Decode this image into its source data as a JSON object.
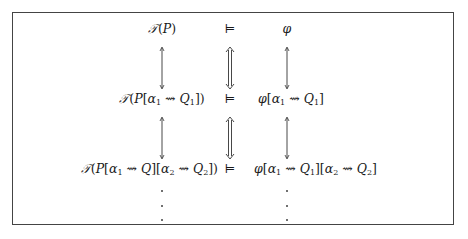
{
  "diagram": {
    "rows": [
      {
        "left": "T(P)",
        "relation": "⊨",
        "right": "φ"
      },
      {
        "left": "T(P[α1 ⇝ Q1])",
        "relation": "⊨",
        "right": "φ[α1 ⇝ Q1]"
      },
      {
        "left": "T(P[α1 ⇝ Q][α2 ⇝ Q2])",
        "relation": "⊨",
        "right": "φ[α1 ⇝ Q1][α2 ⇝ Q2]"
      }
    ],
    "connectors": {
      "left_column": "single double-headed vertical arrow",
      "middle_column": "double-line double-headed vertical arrow (⇕)",
      "right_column": "single double-headed vertical arrow"
    },
    "continuation": "vertical ellipsis below last row",
    "glyphs": {
      "calT": "𝒯",
      "models": "⊨",
      "phi": "φ",
      "alpha": "α",
      "squig": "⇝"
    }
  }
}
